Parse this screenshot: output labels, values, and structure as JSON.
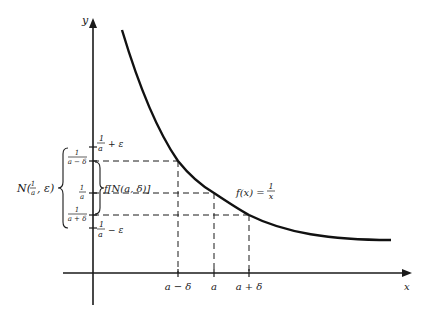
{
  "diagram": {
    "axes": {
      "x_label": "x",
      "y_label": "y"
    },
    "curve_label": {
      "lhs": "f(x) =",
      "num": "1",
      "den": "x"
    },
    "x_ticks": [
      {
        "label": "a − δ"
      },
      {
        "label": "a"
      },
      {
        "label": "a + δ"
      }
    ],
    "y_ticks": {
      "upper_eps": {
        "num": "1",
        "den": "a",
        "suffix": "+ ε"
      },
      "lower_eps": {
        "num": "1",
        "den": "a",
        "suffix": "− ε"
      },
      "f_a_minus_delta": {
        "num": "1",
        "den": "a − δ"
      },
      "f_a": {
        "num": "1",
        "den": "a"
      },
      "f_a_plus_delta": {
        "num": "1",
        "den": "a + δ"
      }
    },
    "image_interval_label": "f[N(a, δ)]",
    "neighborhood_label": {
      "prefix": "N(",
      "num": "1",
      "den": "a",
      "suffix": ", ε)"
    }
  }
}
